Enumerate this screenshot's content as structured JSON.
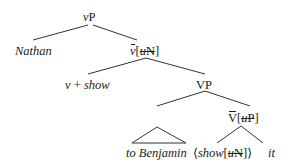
{
  "diagram": {
    "type": "syntax-tree",
    "nodes": {
      "root": {
        "label_head": "v",
        "label_tail": "P"
      },
      "spec": {
        "label": "Nathan"
      },
      "vbar": {
        "head": "v",
        "open": "[",
        "feature_u": "u",
        "feature_cat": "N",
        "close": "]"
      },
      "vhead": {
        "v": "v",
        "plus": " + ",
        "verb": "show"
      },
      "vp": {
        "label": "VP"
      },
      "pp": {
        "label": "to Benjamin"
      },
      "Vbar": {
        "head": "V",
        "open": "[",
        "feature_u": "u",
        "feature_cat": "P",
        "close": "]"
      },
      "trace": {
        "open": "⟨",
        "verb": "show",
        "bopen": "[",
        "feature_u": "u",
        "feature_cat": "N",
        "bclose": "]",
        "close": "⟩"
      },
      "obj": {
        "label": "it"
      }
    }
  }
}
